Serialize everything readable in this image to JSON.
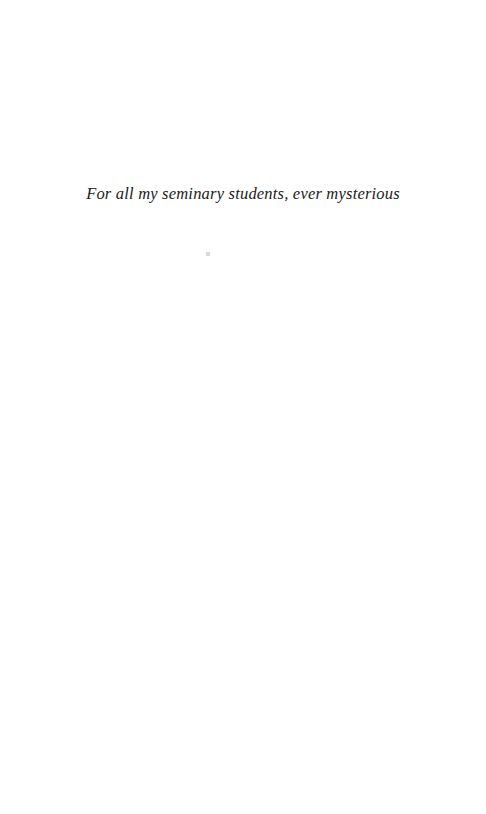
{
  "page": {
    "dedication": "For all my seminary students, ever mysterious",
    "background_color": "#ffffff",
    "text_color": "#212121",
    "artifacts": {
      "speck": "faint-print-speck"
    }
  }
}
